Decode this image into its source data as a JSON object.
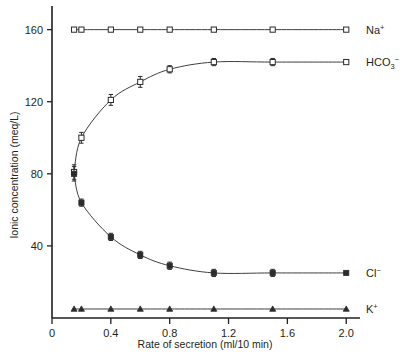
{
  "chart_data": {
    "type": "line",
    "title": "",
    "xlabel": "Rate of secretion (ml/10 min)",
    "ylabel": "Ionic concentration (meq/L)",
    "xlim": [
      0,
      2.08
    ],
    "ylim": [
      0,
      172
    ],
    "xticks": [
      "0",
      "0.4",
      "0.8",
      "1.2",
      "1.6",
      "2.0"
    ],
    "xtick_values": [
      0,
      0.4,
      0.8,
      1.2,
      1.6,
      2.0
    ],
    "yticks": [
      "40",
      "80",
      "120",
      "160"
    ],
    "ytick_values": [
      40,
      80,
      120,
      160
    ],
    "grid": false,
    "legend_position": "right-inline-labels",
    "x": [
      0.15,
      0.2,
      0.4,
      0.6,
      0.8,
      1.1,
      1.5,
      2.0
    ],
    "series": [
      {
        "name": "Na+",
        "label_main": "Na",
        "label_sup": "+",
        "marker": "open-square",
        "values": [
          160,
          160,
          160,
          160,
          160,
          160,
          160,
          160
        ],
        "errors": [
          1,
          1,
          1,
          1,
          1,
          1,
          1,
          1
        ],
        "label_y": 160
      },
      {
        "name": "HCO3-",
        "label_main": "HCO",
        "label_sub": "3",
        "label_sup": "−",
        "marker": "open-square",
        "values": [
          81,
          100,
          121,
          131,
          138,
          142,
          142,
          142
        ],
        "errors": [
          4,
          3,
          3,
          3,
          2,
          2,
          2,
          2
        ],
        "label_y": 142
      },
      {
        "name": "Cl-",
        "label_main": "Cl",
        "label_sup": "−",
        "marker": "filled-square",
        "values": [
          80,
          64,
          45,
          35,
          29,
          25,
          25,
          25
        ],
        "errors": [
          4,
          2,
          2,
          2,
          2,
          2,
          2,
          2
        ],
        "label_y": 25
      },
      {
        "name": "K+",
        "label_main": "K",
        "label_sup": "+",
        "marker": "filled-triangle",
        "values": [
          5,
          5,
          5,
          5,
          5,
          5,
          5,
          5
        ],
        "errors": [
          1,
          1,
          1,
          1,
          1,
          1,
          1,
          1
        ],
        "label_y": 5
      }
    ]
  },
  "colors": {
    "axis": "#231f20",
    "line": "#3f3f3f",
    "marker": "#2b2b2b",
    "background": "#ffffff"
  }
}
